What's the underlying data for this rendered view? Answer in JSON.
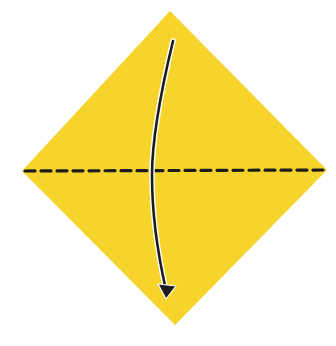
{
  "diagram": {
    "type": "origami-fold-step",
    "paper": {
      "shape": "diamond",
      "color": "#F6D42B",
      "vertices": {
        "top": [
          170,
          11
        ],
        "right": [
          327,
          170
        ],
        "bottom": [
          175,
          325
        ],
        "left": [
          22,
          171
        ]
      }
    },
    "fold_line": {
      "style": "valley-fold-dashed",
      "color": "#1c1c1c",
      "from": [
        25,
        171
      ],
      "to": [
        325,
        170
      ],
      "dash": "10 6",
      "width": 3.2
    },
    "arrow": {
      "color": "#1c1c1c",
      "halo": "#ffffff",
      "path": "M173,41 C160,95 152,140 152,175 C152,220 158,255 166,290",
      "head_tip": [
        166,
        298
      ],
      "meaning": "fold top corner down to bottom corner"
    }
  }
}
